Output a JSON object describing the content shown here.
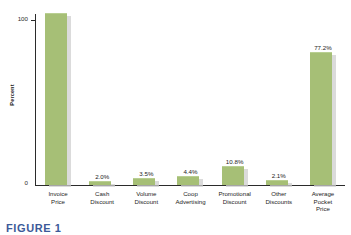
{
  "caption": "FIGURE 1",
  "chart_data": {
    "type": "bar",
    "title": "",
    "xlabel": "",
    "ylabel": "Percent",
    "ylim": [
      0,
      100
    ],
    "yticks": [
      "0",
      "100"
    ],
    "grid": false,
    "legend": null,
    "categories": [
      "Invoice Price",
      "Cash Discount",
      "Volume Discount",
      "Coop Advertising",
      "Promotional Discount",
      "Other Discounts",
      "Average Pocket Price"
    ],
    "category_lines": [
      [
        "Invoice",
        "Price"
      ],
      [
        "Cash",
        "Discount"
      ],
      [
        "Volume",
        "Discount"
      ],
      [
        "Coop",
        "Advertising"
      ],
      [
        "Promotional",
        "Discount"
      ],
      [
        "Other",
        "Discounts"
      ],
      [
        "Average",
        "Pocket",
        "Price"
      ]
    ],
    "values": [
      100,
      2.0,
      3.5,
      4.4,
      10.8,
      2.1,
      77.2
    ],
    "data_labels": [
      "",
      "2.0%",
      "3.5%",
      "4.4%",
      "10.8%",
      "2.1%",
      "77.2%"
    ],
    "bar_color": "#a6bf76",
    "shadow_color": "#cfcfcf",
    "axis_color": "#2b2b2b"
  }
}
